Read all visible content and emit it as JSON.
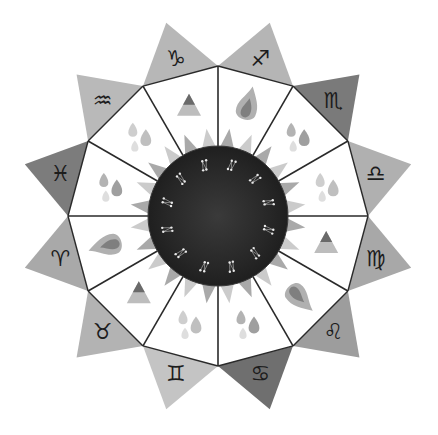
{
  "canvas": {
    "width": 438,
    "height": 435,
    "background": "#ffffff"
  },
  "center": {
    "x": 218,
    "y": 216
  },
  "colors": {
    "line": "#2a2a2a",
    "circle": "#2b2b2b",
    "circle_edge": "#3a3a3a",
    "star": "#e8e8e8",
    "sun_ray": "#9a9a9a",
    "sun_ray_light": "#c2c2c2"
  },
  "geometry": {
    "junction_radius": 150,
    "tip_radius": 200,
    "circle_radius": 70,
    "ray_inner": 62,
    "ray_outer": 88,
    "rotation_deg": -90
  },
  "signs": [
    {
      "name": "Sagittarius",
      "glyph": "♐",
      "fill": "#b5b5b5",
      "element": "fire"
    },
    {
      "name": "Scorpio",
      "glyph": "♏",
      "fill": "#7a7a7a",
      "element": "water"
    },
    {
      "name": "Libra",
      "glyph": "♎",
      "fill": "#b0b0b0",
      "element": "air"
    },
    {
      "name": "Virgo",
      "glyph": "♍",
      "fill": "#a8a8a8",
      "element": "earth"
    },
    {
      "name": "Leo",
      "glyph": "♌",
      "fill": "#9d9d9d",
      "element": "fire"
    },
    {
      "name": "Cancer",
      "glyph": "♋",
      "fill": "#6f6f6f",
      "element": "water"
    },
    {
      "name": "Gemini",
      "glyph": "♊",
      "fill": "#c4c4c4",
      "element": "air"
    },
    {
      "name": "Taurus",
      "glyph": "♉",
      "fill": "#b3b3b3",
      "element": "earth"
    },
    {
      "name": "Aries",
      "glyph": "♈",
      "fill": "#a9a9a9",
      "element": "fire"
    },
    {
      "name": "Pisces",
      "glyph": "♓",
      "fill": "#7c7c7c",
      "element": "water"
    },
    {
      "name": "Aquarius",
      "glyph": "♒",
      "fill": "#b9b9b9",
      "element": "air"
    },
    {
      "name": "Capricorn",
      "glyph": "♑",
      "fill": "#b7b7b7",
      "element": "earth"
    }
  ],
  "element_icons": {
    "fire": "flame-icon",
    "water": "droplet-icon",
    "air": "droplet-icon",
    "earth": "triangle-icon"
  }
}
